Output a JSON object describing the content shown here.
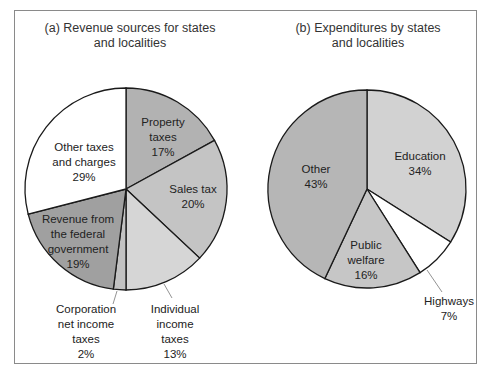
{
  "chart_data": [
    {
      "type": "pie",
      "title": "(a) Revenue sources for states and localities",
      "title_lines": [
        "(a) Revenue sources for states",
        "and localities"
      ],
      "categories": [
        "Property taxes",
        "Sales tax",
        "Individual income taxes",
        "Corporation net income taxes",
        "Revenue from the federal government",
        "Other taxes and charges"
      ],
      "values": [
        17,
        20,
        13,
        2,
        19,
        29
      ],
      "unit": "%",
      "colors": [
        "#b2b2b2",
        "#c4c4c4",
        "#d6d6d6",
        "#c2c2c2",
        "#a0a0a0",
        "#ffffff"
      ],
      "labels": [
        {
          "lines": [
            "Property",
            "taxes",
            "17%"
          ]
        },
        {
          "lines": [
            "Sales tax",
            "20%"
          ]
        },
        {
          "lines": [
            "Individual",
            "income",
            "taxes",
            "13%"
          ]
        },
        {
          "lines": [
            "Corporation",
            "net income",
            "taxes",
            "2%"
          ]
        },
        {
          "lines": [
            "Revenue from",
            "the federal",
            "government",
            "19%"
          ]
        },
        {
          "lines": [
            "Other taxes",
            "and charges",
            "29%"
          ]
        }
      ]
    },
    {
      "type": "pie",
      "title": "(b) Expenditures by states and localities",
      "title_lines": [
        "(b) Expenditures by states",
        "and localities"
      ],
      "categories": [
        "Education",
        "Highways",
        "Public welfare",
        "Other"
      ],
      "values": [
        34,
        7,
        16,
        43
      ],
      "unit": "%",
      "colors": [
        "#d2d2d2",
        "#ffffff",
        "#c6c6c6",
        "#b6b6b6"
      ],
      "labels": [
        {
          "lines": [
            "Education",
            "34%"
          ]
        },
        {
          "lines": [
            "Highways",
            "7%"
          ]
        },
        {
          "lines": [
            "Public",
            "welfare",
            "16%"
          ]
        },
        {
          "lines": [
            "Other",
            "43%"
          ]
        }
      ]
    }
  ]
}
